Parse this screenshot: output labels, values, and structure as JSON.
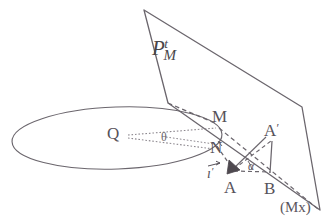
{
  "figure": {
    "title_label": "",
    "stroke_color": "#6b666d",
    "dash_color": "#6b666d",
    "dot_color": "#8d888f",
    "background": "#ffffff",
    "labels": {
      "plane_base": "P",
      "plane_sub": "M",
      "plane_sup": "t",
      "point_q": "Q",
      "angle_theta": "θ",
      "point_m": "M",
      "point_n": "N",
      "point_a": "A",
      "point_a_prime_base": "A",
      "point_a_prime_mark": "′",
      "point_b": "B",
      "angle_alpha": "α",
      "vector_i_base": "ı",
      "vector_i_mark": "′",
      "axis_mx": "(Mx)"
    },
    "geometry": {
      "ellipse": {
        "cx": 117,
        "cy": 138,
        "rx": 105,
        "ry": 31,
        "rotation_deg": -2
      },
      "plane_polygon": [
        [
          144,
          10
        ],
        [
          302,
          107
        ],
        [
          320,
          210
        ],
        [
          168,
          103
        ]
      ],
      "points": {
        "Q": [
          117,
          135
        ],
        "M": [
          219,
          127
        ],
        "N": [
          217,
          148
        ],
        "A": [
          231,
          171
        ],
        "A_prime": [
          272,
          139
        ],
        "B": [
          270,
          172
        ]
      },
      "solid_segments": [
        [
          "A_prime",
          "B"
        ],
        [
          "A",
          "A_prime"
        ]
      ],
      "dashed_segments": [
        [
          "plane_lower_left",
          "M"
        ],
        [
          "M",
          "B_far"
        ],
        [
          "N",
          "A"
        ],
        [
          "A",
          "B"
        ],
        [
          "A",
          "A_prime"
        ],
        [
          "M",
          "Mx"
        ]
      ],
      "dotted_segments": [
        [
          "Q",
          "M"
        ],
        [
          "Q",
          "N"
        ]
      ]
    }
  }
}
